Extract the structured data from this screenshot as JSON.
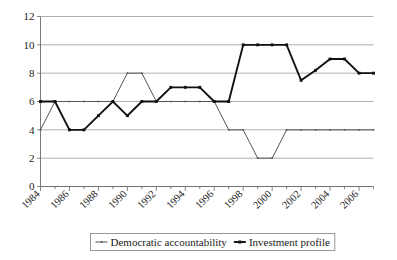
{
  "chart_data": {
    "type": "line",
    "title": "",
    "xlabel": "",
    "ylabel": "",
    "ylim": [
      0,
      12
    ],
    "ytick_values": [
      0,
      2,
      4,
      6,
      8,
      10,
      12
    ],
    "ytick_labels": [
      "0",
      "2",
      "4",
      "6",
      "8",
      "10",
      "12"
    ],
    "grid": true,
    "legend_position": "bottom",
    "x": [
      1984,
      1985,
      1986,
      1987,
      1988,
      1989,
      1990,
      1991,
      1992,
      1993,
      1994,
      1995,
      1996,
      1997,
      1998,
      1999,
      2000,
      2001,
      2002,
      2003,
      2004,
      2005,
      2006,
      2007
    ],
    "xtick_labels": [
      "1984",
      "1986",
      "1988",
      "1990",
      "1992",
      "1994",
      "1996",
      "1998",
      "2000",
      "2002",
      "2004",
      "2006"
    ],
    "xtick_values": [
      1984,
      1986,
      1988,
      1990,
      1992,
      1994,
      1996,
      1998,
      2000,
      2002,
      2004,
      2006
    ],
    "series": [
      {
        "name": "Democratic accountability",
        "color": "#555555",
        "values": [
          4,
          6,
          6,
          6,
          6,
          6,
          8,
          8,
          6,
          6,
          6,
          6,
          6,
          4,
          4,
          2,
          2,
          4,
          4,
          4,
          4,
          4,
          4,
          4
        ]
      },
      {
        "name": "Investment profile",
        "color": "#111111",
        "values": [
          6,
          6,
          4,
          4,
          5,
          6,
          5,
          6,
          6,
          7,
          7,
          7,
          6,
          6,
          10,
          10,
          10,
          10,
          7.5,
          8.2,
          9,
          9,
          8,
          8
        ]
      }
    ]
  },
  "legend": {
    "entries": [
      {
        "label": "Democratic accountability",
        "marker": "thin-line-marker"
      },
      {
        "label": "Investment profile",
        "marker": "thick-line-marker"
      }
    ]
  }
}
